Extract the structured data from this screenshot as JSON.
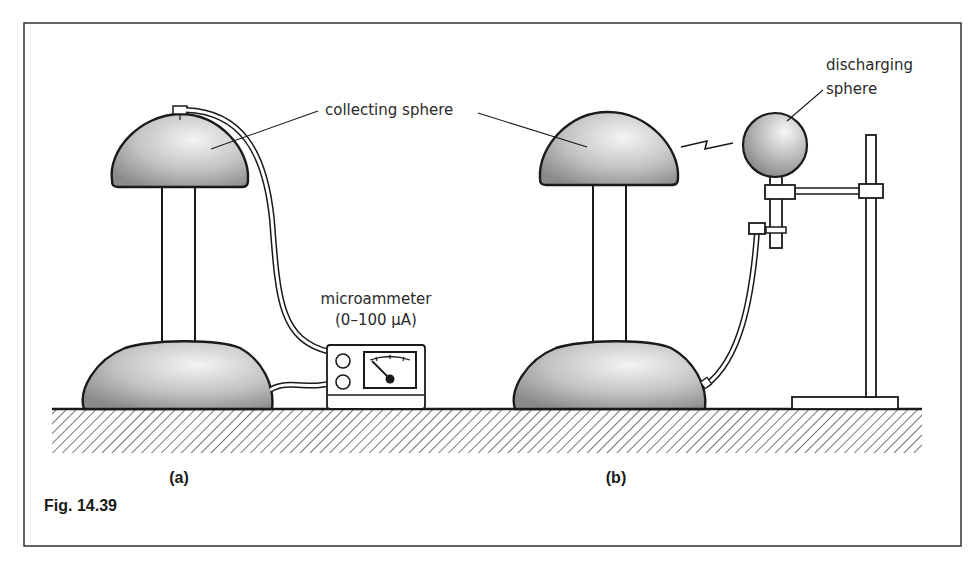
{
  "figure": {
    "caption": "Fig. 14.39",
    "panels": [
      {
        "id": "a",
        "label": "(a)"
      },
      {
        "id": "b",
        "label": "(b)"
      }
    ]
  },
  "labels": {
    "collecting_sphere": "collecting sphere",
    "microammeter_line1": "microammeter",
    "microammeter_line2": "(0–100 μA)",
    "discharging_line1": "discharging",
    "discharging_line2": "sphere"
  },
  "colors": {
    "ink": "#1a1a1a",
    "dome_dark": "#8e8e8e",
    "dome_light": "#f2f2f2",
    "frame": "#333333",
    "background": "#ffffff"
  }
}
